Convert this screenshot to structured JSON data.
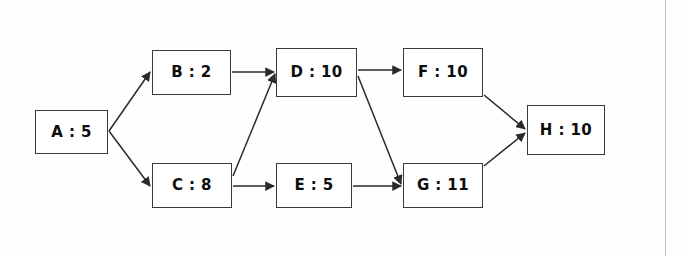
{
  "diagram": {
    "type": "directed-acyclic-graph",
    "background_color": "#fefefe",
    "node_border_color": "#3a3a3a",
    "edge_color": "#2a2a2a",
    "text_color": "#0d0d0d",
    "divider_color": "#b9b9b9",
    "nodes": [
      {
        "id": "A",
        "label": "A : 5",
        "name": "A",
        "value": 5,
        "x": 35,
        "y": 110,
        "w": 73,
        "h": 44
      },
      {
        "id": "B",
        "label": "B : 2",
        "name": "B",
        "value": 2,
        "x": 152,
        "y": 50,
        "w": 79,
        "h": 45
      },
      {
        "id": "C",
        "label": "C : 8",
        "name": "C",
        "value": 8,
        "x": 152,
        "y": 163,
        "w": 80,
        "h": 45
      },
      {
        "id": "D",
        "label": "D : 10",
        "name": "D",
        "value": 10,
        "x": 276,
        "y": 48,
        "w": 81,
        "h": 49
      },
      {
        "id": "E",
        "label": "E : 5",
        "name": "E",
        "value": 5,
        "x": 276,
        "y": 163,
        "w": 76,
        "h": 45
      },
      {
        "id": "F",
        "label": "F : 10",
        "name": "F",
        "value": 10,
        "x": 403,
        "y": 48,
        "w": 80,
        "h": 49
      },
      {
        "id": "G",
        "label": "G : 11",
        "name": "G",
        "value": 11,
        "x": 403,
        "y": 163,
        "w": 80,
        "h": 45
      },
      {
        "id": "H",
        "label": "H : 10",
        "name": "H",
        "value": 10,
        "x": 527,
        "y": 105,
        "w": 78,
        "h": 50
      }
    ],
    "edges": [
      {
        "from": "A",
        "to": "B",
        "x1": 109,
        "y1": 131,
        "x2": 150,
        "y2": 72
      },
      {
        "from": "A",
        "to": "C",
        "x1": 109,
        "y1": 131,
        "x2": 150,
        "y2": 186
      },
      {
        "from": "B",
        "to": "D",
        "x1": 232,
        "y1": 72,
        "x2": 274,
        "y2": 72
      },
      {
        "from": "C",
        "to": "D",
        "x1": 233,
        "y1": 176,
        "x2": 275,
        "y2": 74
      },
      {
        "from": "C",
        "to": "E",
        "x1": 233,
        "y1": 186,
        "x2": 274,
        "y2": 186
      },
      {
        "from": "D",
        "to": "F",
        "x1": 358,
        "y1": 70,
        "x2": 401,
        "y2": 70
      },
      {
        "from": "D",
        "to": "G",
        "x1": 358,
        "y1": 76,
        "x2": 401,
        "y2": 184
      },
      {
        "from": "E",
        "to": "G",
        "x1": 353,
        "y1": 186,
        "x2": 401,
        "y2": 186
      },
      {
        "from": "F",
        "to": "H",
        "x1": 484,
        "y1": 95,
        "x2": 525,
        "y2": 129
      },
      {
        "from": "G",
        "to": "H",
        "x1": 484,
        "y1": 166,
        "x2": 525,
        "y2": 133
      }
    ]
  }
}
